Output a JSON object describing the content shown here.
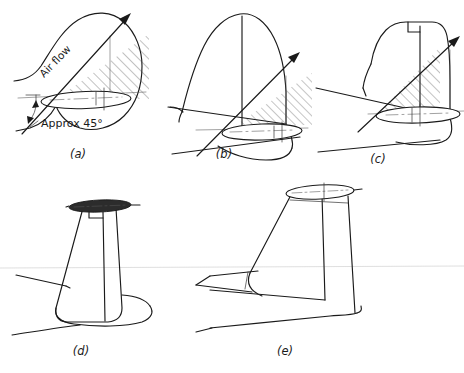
{
  "figure": {
    "background_color": "#ffffff",
    "ink_color": "#1a1a1a",
    "width": 464,
    "height": 373
  },
  "annotations": {
    "airflow_label": "Air flow",
    "angle_label": "Approx 45°"
  },
  "panels": [
    {
      "id": "a",
      "label": "(a)",
      "label_x": 78,
      "label_y": 158,
      "description": "Rounded fin with fuselage outline, airflow arrow at 45 degrees and hatched shadowed area",
      "has_airflow_arrow": true,
      "has_hatching": true,
      "has_airflow_label": true,
      "has_angle_label": true,
      "tailplane_style": "none"
    },
    {
      "id": "b",
      "label": "(b)",
      "label_x": 224,
      "label_y": 158,
      "description": "Tall rounded fin with rudder hinge line, airflow arrow and small hatched area",
      "has_airflow_arrow": true,
      "has_hatching": true,
      "has_airflow_label": false,
      "has_angle_label": false,
      "tailplane_style": "none"
    },
    {
      "id": "c",
      "label": "(c)",
      "label_x": 378,
      "label_y": 163,
      "description": "Swept fin with dorsal fillet and rudder cutout, airflow arrow with large hatched area",
      "has_airflow_arrow": true,
      "has_hatching": true,
      "has_airflow_label": false,
      "has_angle_label": false,
      "tailplane_style": "none"
    },
    {
      "id": "d",
      "label": "(d)",
      "label_x": 81,
      "label_y": 355,
      "description": "Tapered fin with tailplane mounted at the fin tip shown edge on as a filled ellipse",
      "has_airflow_arrow": false,
      "has_hatching": false,
      "has_airflow_label": false,
      "has_angle_label": false,
      "tailplane_style": "filled-ellipse"
    },
    {
      "id": "e",
      "label": "(e)",
      "label_x": 285,
      "label_y": 355,
      "description": "T-tail configuration, tall fin with high mounted tailplane shown as an open ellipse",
      "has_airflow_arrow": false,
      "has_hatching": false,
      "has_airflow_label": false,
      "has_angle_label": false,
      "tailplane_style": "open-ellipse"
    }
  ]
}
